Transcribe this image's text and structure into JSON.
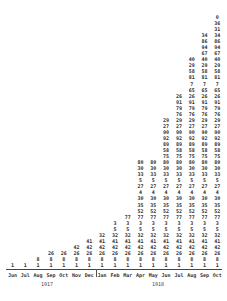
{
  "chart_data": {
    "type": "table",
    "title": "",
    "xlabel": "",
    "ylabel": "",
    "categories": [
      "Jun",
      "Jul",
      "Aug",
      "Sep",
      "Oct",
      "Nov",
      "Dec",
      "Jan",
      "Feb",
      "Mar",
      "Apr",
      "May",
      "Jun",
      "Jul",
      "Aug",
      "Sep",
      "Oct"
    ],
    "years": [
      {
        "label": "1917",
        "months": [
          "Jun",
          "Jul",
          "Aug",
          "Sep",
          "Oct",
          "Nov",
          "Dec"
        ]
      },
      {
        "label": "1918",
        "months": [
          "Jan",
          "Feb",
          "Mar",
          "Apr",
          "May",
          "Jun",
          "Jul",
          "Aug",
          "Sep",
          "Oct"
        ]
      }
    ],
    "stack_sequence_bottom_to_top": [
      1,
      8,
      26,
      42,
      41,
      32,
      5,
      3,
      77,
      52,
      35,
      30,
      4,
      27,
      5,
      33,
      30,
      80,
      75,
      58,
      89,
      92,
      90,
      27,
      29,
      76,
      79,
      91,
      26,
      65,
      7,
      81,
      58,
      29,
      40,
      67,
      94,
      86,
      34,
      31,
      36,
      0
    ],
    "values": [
      1,
      1,
      2,
      3,
      3,
      4,
      5,
      6,
      8,
      9,
      18,
      18,
      25,
      29,
      35,
      39,
      42
    ]
  },
  "axis": {
    "months": [
      "Jun",
      "Jul",
      "Aug",
      "Sep",
      "Oct",
      "Nov",
      "Dec",
      "Jan",
      "Feb",
      "Mar",
      "Apr",
      "May",
      "Jun",
      "Jul",
      "Aug",
      "Sep",
      "Oct"
    ],
    "year_1": "1917",
    "year_2": "1918"
  }
}
